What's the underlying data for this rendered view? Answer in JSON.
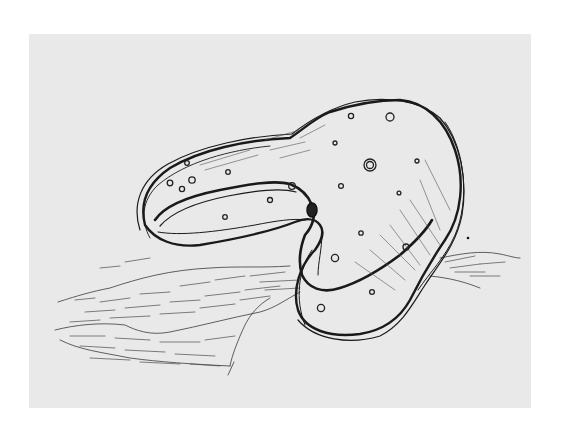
{
  "image": {
    "kind": "pen-and-ink sketch",
    "subject": "bent, spotted rock-like organic form resting on a hatched ground slab",
    "colors": {
      "margin": "#ffffff",
      "paper": "#e9e9e9",
      "ink": "#1a1a1a"
    },
    "paper_bounds": {
      "x": 29,
      "y": 34,
      "width": 502,
      "height": 374
    }
  }
}
